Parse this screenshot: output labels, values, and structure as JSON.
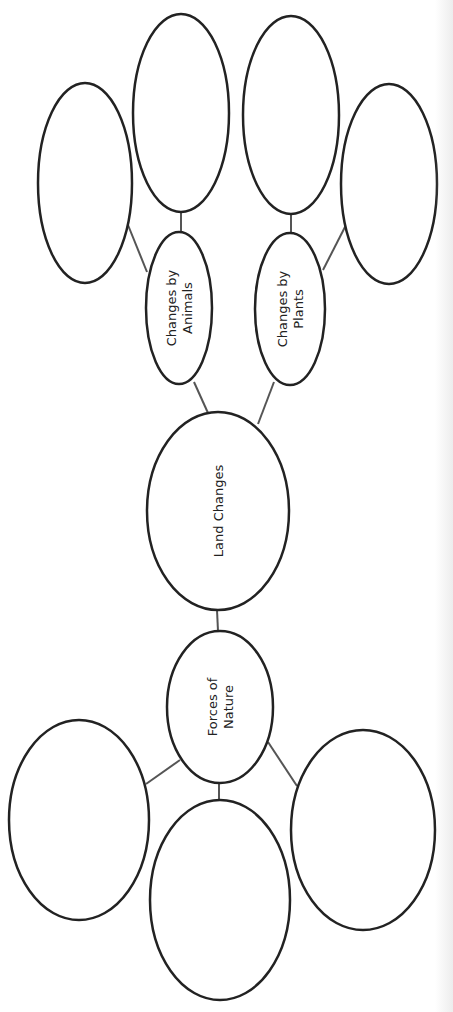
{
  "diagram": {
    "title": "Land Changes",
    "orientation": "rotated-90-ccw",
    "colors": {
      "stroke": "#222222",
      "edge": "#555555",
      "background": "#ffffff"
    },
    "nodes": [
      {
        "id": "land",
        "label_lines": [
          "Land Changes"
        ],
        "cx": 218,
        "cy": 511,
        "rx": 71,
        "ry": 99
      },
      {
        "id": "forces",
        "label_lines": [
          "Forces of",
          "Nature"
        ],
        "cx": 220,
        "cy": 707,
        "rx": 53,
        "ry": 76
      },
      {
        "id": "animals",
        "label_lines": [
          "Changes by",
          "Animals"
        ],
        "cx": 179,
        "cy": 308,
        "rx": 33,
        "ry": 76
      },
      {
        "id": "plants",
        "label_lines": [
          "Changes by",
          "Plants"
        ],
        "cx": 290,
        "cy": 309,
        "rx": 35,
        "ry": 76
      },
      {
        "id": "animals_blank_1",
        "label_lines": [],
        "cx": 85,
        "cy": 183,
        "rx": 47,
        "ry": 100
      },
      {
        "id": "animals_blank_2",
        "label_lines": [],
        "cx": 181,
        "cy": 113,
        "rx": 48,
        "ry": 99
      },
      {
        "id": "plants_blank_1",
        "label_lines": [],
        "cx": 291,
        "cy": 115,
        "rx": 48,
        "ry": 99
      },
      {
        "id": "plants_blank_2",
        "label_lines": [],
        "cx": 389,
        "cy": 184,
        "rx": 48,
        "ry": 100
      },
      {
        "id": "forces_blank_1",
        "label_lines": [],
        "cx": 79,
        "cy": 820,
        "rx": 70,
        "ry": 100
      },
      {
        "id": "forces_blank_2",
        "label_lines": [],
        "cx": 220,
        "cy": 900,
        "rx": 70,
        "ry": 100
      },
      {
        "id": "forces_blank_3",
        "label_lines": [],
        "cx": 363,
        "cy": 830,
        "rx": 72,
        "ry": 100
      }
    ],
    "edges": [
      {
        "from": "land",
        "to": "forces",
        "x1": 217,
        "y1": 610,
        "x2": 218,
        "y2": 631
      },
      {
        "from": "land",
        "to": "animals",
        "x1": 208,
        "y1": 413,
        "x2": 194,
        "y2": 382
      },
      {
        "from": "land",
        "to": "plants",
        "x1": 258,
        "y1": 424,
        "x2": 274,
        "y2": 382
      },
      {
        "from": "animals",
        "to": "animals_blank_1",
        "x1": 147,
        "y1": 272,
        "x2": 128,
        "y2": 225
      },
      {
        "from": "animals",
        "to": "animals_blank_2",
        "x1": 181,
        "y1": 232,
        "x2": 181,
        "y2": 213
      },
      {
        "from": "plants",
        "to": "plants_blank_1",
        "x1": 291,
        "y1": 234,
        "x2": 291,
        "y2": 214
      },
      {
        "from": "plants",
        "to": "plants_blank_2",
        "x1": 323,
        "y1": 270,
        "x2": 346,
        "y2": 225
      },
      {
        "from": "forces",
        "to": "forces_blank_1",
        "x1": 180,
        "y1": 760,
        "x2": 146,
        "y2": 784
      },
      {
        "from": "forces",
        "to": "forces_blank_2",
        "x1": 219,
        "y1": 783,
        "x2": 219,
        "y2": 800
      },
      {
        "from": "forces",
        "to": "forces_blank_3",
        "x1": 268,
        "y1": 742,
        "x2": 297,
        "y2": 786
      }
    ]
  }
}
